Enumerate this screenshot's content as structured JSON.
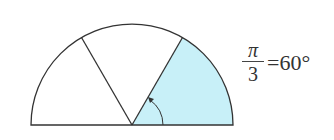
{
  "diagram": {
    "shape": "semicircle",
    "center": [
      132,
      125
    ],
    "radius": 101,
    "divider_angles_deg": [
      60,
      120
    ],
    "shaded_sector": {
      "from_deg": 0,
      "to_deg": 60,
      "color": "#c8f0f8"
    },
    "stroke_color": "#333333",
    "angle_arrow": {
      "from_deg": 0,
      "to_deg": 60,
      "radius": 31
    }
  },
  "label": {
    "numerator": "π",
    "denominator": "3",
    "equals": "=60°"
  }
}
